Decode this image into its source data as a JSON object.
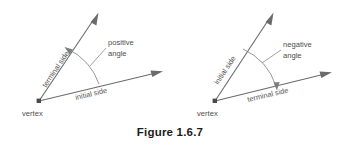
{
  "figure": {
    "caption": "Figure 1.6.7",
    "caption_color": "#1c1c1c",
    "background_color": "#ffffff",
    "line_color": "#6b6b6b",
    "label_color": "#4d4d4d"
  },
  "diagrams": [
    {
      "id": "positive-angle-diagram",
      "position": "left",
      "vertex_label": "vertex",
      "initial_side_label": "initial side",
      "terminal_side_label": "terminal side",
      "angle_label_line1": "positive",
      "angle_label_line2": "angle",
      "rotation_direction": "counterclockwise"
    },
    {
      "id": "negative-angle-diagram",
      "position": "right",
      "vertex_label": "vertex",
      "initial_side_label": "initial side",
      "terminal_side_label": "terminal side",
      "angle_label_line1": "negative",
      "angle_label_line2": "angle",
      "rotation_direction": "clockwise"
    }
  ]
}
